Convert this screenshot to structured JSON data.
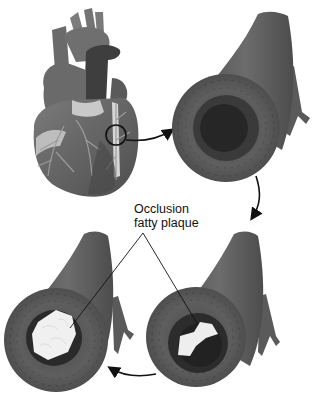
{
  "diagram": {
    "label": {
      "line1": "Occlusion",
      "line2": "fatty plaque"
    },
    "panels": [
      {
        "id": "heart",
        "description": "Heart with coronary arteries, circled region on artery"
      },
      {
        "id": "artery-healthy",
        "description": "Cross-section of artery with open lumen"
      },
      {
        "id": "artery-partial",
        "description": "Cross-section with small fatty plaque deposit"
      },
      {
        "id": "artery-occluded",
        "description": "Cross-section with large fatty plaque deposit"
      }
    ],
    "flow": [
      "heart",
      "artery-healthy",
      "artery-partial",
      "artery-occluded"
    ],
    "colors": {
      "vessel_wall": "#5a5a5a",
      "vessel_dark": "#3c3c3c",
      "lumen": "#262626",
      "plaque": "#eeeeee",
      "heart_body": "#6e6e6e",
      "arrow": "#111111"
    }
  }
}
